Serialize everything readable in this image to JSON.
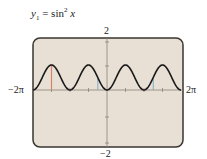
{
  "title": {
    "y": "y",
    "sub": "1",
    "eq": " = ",
    "fn": "sin",
    "exp": "2",
    "var": " x"
  },
  "labels": {
    "ymax": "2",
    "ymin": "−2",
    "xmin": "−2π",
    "xmax": "2π"
  },
  "colors": {
    "screen": "#e8e0d4",
    "border": "#3a3530",
    "curve": "#1a1a1a",
    "axis": "#8a8278",
    "red_marker": "#d9826a",
    "blue_marker": "#8fb4c8"
  },
  "chart_data": {
    "type": "line",
    "function": "sin(x)^2",
    "xlim": [
      -6.2832,
      6.2832
    ],
    "ylim": [
      -2,
      2
    ],
    "x_tick_labels": [
      "-2π",
      "2π"
    ],
    "y_tick_labels": [
      "-2",
      "2"
    ],
    "x_scale": "π/2",
    "y_scale": 1,
    "grid": false,
    "period": "π",
    "peaks_x": [
      "-3π/2",
      "-π/2",
      "π/2",
      "3π/2"
    ],
    "peak_value": 1,
    "min_value": 0,
    "markers": [
      {
        "x": "-3π/2",
        "color": "red",
        "from": 0,
        "to": 1
      },
      {
        "x": "-π/4",
        "color": "blue",
        "from": 0,
        "to": 0.5
      },
      {
        "x": "5π/4",
        "color": "blue",
        "from": 0,
        "to": 0.5
      }
    ]
  }
}
